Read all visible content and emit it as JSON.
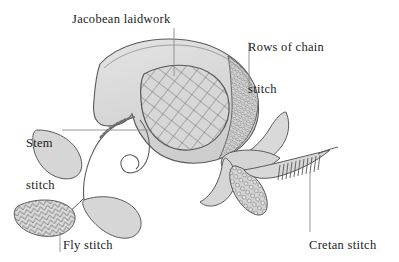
{
  "figure": {
    "background_color": "#ffffff",
    "ink_color": "#4a4a4a",
    "fill_light": "#dcdcdc",
    "fill_mid": "#c9c9c9",
    "fill_dark": "#b4b4b4",
    "leader_color": "#8a8a8a",
    "text_color": "#1a1a1a"
  },
  "labels": {
    "jacobean": {
      "text": "Jacobean laidwork",
      "lines": [
        "Jacobean laidwork"
      ],
      "x": 72,
      "y": 12
    },
    "chain": {
      "text": "Rows of chain stitch",
      "line1": "Rows of chain",
      "line2": "stitch",
      "x": 248,
      "y": 12
    },
    "stem": {
      "text": "Stem stitch",
      "line1": "Stem",
      "line2": "stitch",
      "x": 26,
      "y": 108
    },
    "fly": {
      "text": "Fly stitch",
      "lines": [
        "Fly stitch"
      ],
      "x": 63,
      "y": 238
    },
    "cretan": {
      "text": "Cretan stitch",
      "lines": [
        "Cretan stitch"
      ],
      "x": 309,
      "y": 238
    }
  },
  "parts": [
    {
      "name": "main-petal",
      "stitch": "Jacobean laidwork",
      "fill": "lattice-grid"
    },
    {
      "name": "chain-band",
      "stitch": "Rows of chain stitch",
      "fill": "dense-cells"
    },
    {
      "name": "stem-line",
      "stitch": "Stem stitch",
      "fill": "line"
    },
    {
      "name": "fly-leaf",
      "stitch": "Fly stitch",
      "fill": "chevron-rows"
    },
    {
      "name": "cretan-spike",
      "stitch": "Cretan stitch",
      "fill": "ladder-rungs"
    }
  ]
}
